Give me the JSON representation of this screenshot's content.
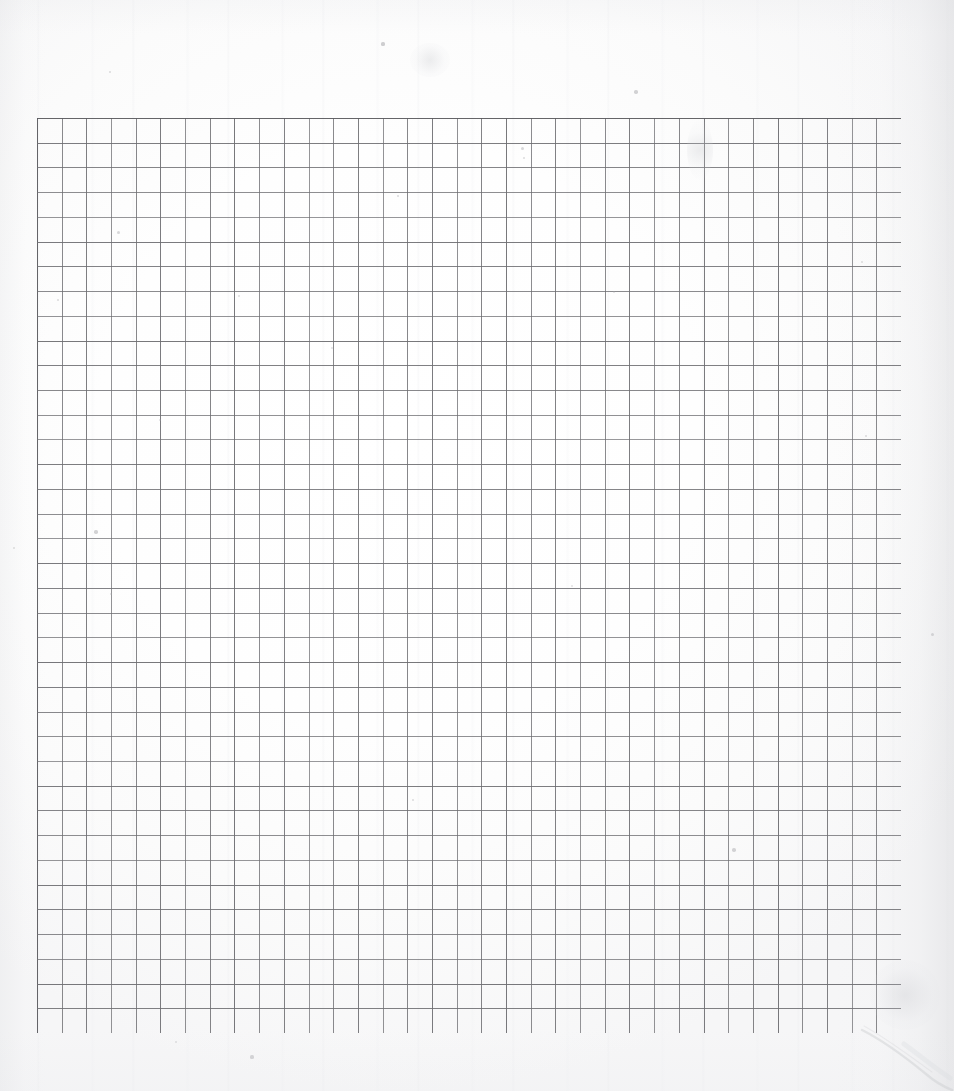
{
  "document": {
    "kind": "scanned-graph-paper",
    "title": "Blank graph paper sheet (scan)",
    "page_width": 954,
    "page_height": 1091,
    "paper_color": "#fdfdfd",
    "has_text": false,
    "has_handwriting": false,
    "visible_text": ""
  },
  "grid": {
    "label": "ruled square grid",
    "origin_x": 37,
    "origin_y": 118,
    "width": 864,
    "height": 915,
    "columns": 35,
    "rows": 37,
    "cell_width": 24.69,
    "cell_height": 24.73,
    "line_color": "#6e6e72",
    "border_color": "#5d5d61",
    "line_width": 1.1,
    "border_width": 1.5,
    "emphasis_lines": "none",
    "axis_labels": "none",
    "tick_labels": "none"
  },
  "artifacts": {
    "crease": {
      "name": "diagonal paper crease",
      "location": "bottom-right margin",
      "color": "#c9cace"
    },
    "specks": [
      {
        "x": 383,
        "y": 44,
        "r": 1.6,
        "o": 0.55
      },
      {
        "x": 636,
        "y": 92,
        "r": 1.8,
        "o": 0.5
      },
      {
        "x": 110,
        "y": 72,
        "r": 1.2,
        "o": 0.4
      },
      {
        "x": 522,
        "y": 148,
        "r": 1.5,
        "o": 0.45
      },
      {
        "x": 524,
        "y": 158,
        "r": 1.3,
        "o": 0.4
      },
      {
        "x": 398,
        "y": 196,
        "r": 1.4,
        "o": 0.42
      },
      {
        "x": 118,
        "y": 232,
        "r": 1.5,
        "o": 0.45
      },
      {
        "x": 58,
        "y": 300,
        "r": 1.3,
        "o": 0.4
      },
      {
        "x": 239,
        "y": 296,
        "r": 1.2,
        "o": 0.36
      },
      {
        "x": 614,
        "y": 292,
        "r": 1.2,
        "o": 0.36
      },
      {
        "x": 862,
        "y": 262,
        "r": 1.3,
        "o": 0.38
      },
      {
        "x": 332,
        "y": 348,
        "r": 1.2,
        "o": 0.34
      },
      {
        "x": 160,
        "y": 420,
        "r": 1.2,
        "o": 0.34
      },
      {
        "x": 866,
        "y": 436,
        "r": 1.4,
        "o": 0.4
      },
      {
        "x": 96,
        "y": 532,
        "r": 1.7,
        "o": 0.5
      },
      {
        "x": 14,
        "y": 548,
        "r": 1.3,
        "o": 0.38
      },
      {
        "x": 111,
        "y": 594,
        "r": 1.3,
        "o": 0.36
      },
      {
        "x": 932,
        "y": 634,
        "r": 1.5,
        "o": 0.42
      },
      {
        "x": 572,
        "y": 586,
        "r": 1.2,
        "o": 0.33
      },
      {
        "x": 413,
        "y": 800,
        "r": 1.4,
        "o": 0.4
      },
      {
        "x": 734,
        "y": 850,
        "r": 1.7,
        "o": 0.48
      },
      {
        "x": 252,
        "y": 1057,
        "r": 1.6,
        "o": 0.45
      },
      {
        "x": 176,
        "y": 1042,
        "r": 1.2,
        "o": 0.33
      }
    ],
    "smudges": [
      {
        "x": 700,
        "y": 150,
        "w": 26,
        "h": 60
      },
      {
        "x": 430,
        "y": 60,
        "w": 40,
        "h": 34
      },
      {
        "x": 905,
        "y": 995,
        "w": 70,
        "h": 70
      }
    ]
  }
}
